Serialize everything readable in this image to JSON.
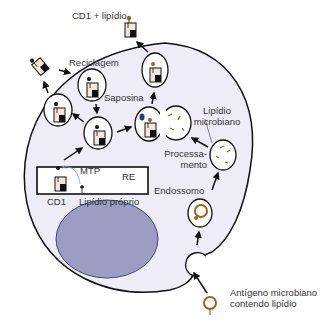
{
  "colors": {
    "cell_fill": "#eeedf7",
    "nucleus_fill": "#9d9dc4",
    "nucleus_stroke": "#3e4a7a",
    "outline": "#111111",
    "lipid_brown": "#a0621a",
    "saposin_blue": "#1f3f73",
    "cd1_fill": "#f3e7dc"
  },
  "labels": {
    "cd1_lipid": "CD1 + lipídio",
    "recycling": "Reciclagem",
    "saposin": "Saposina",
    "microbial_lipid_line1": "Lipídio",
    "microbial_lipid_line2": "microbiano",
    "processing_line1": "Processa-",
    "processing_line2": "mento",
    "endosome": "Endossomo",
    "mtp": "MTP",
    "er": "RE",
    "cd1": "CD1",
    "self_lipid": "Lipídio próprio",
    "antigen_line1": "Antígeno microbiano",
    "antigen_line2": "contendo lipídio"
  }
}
